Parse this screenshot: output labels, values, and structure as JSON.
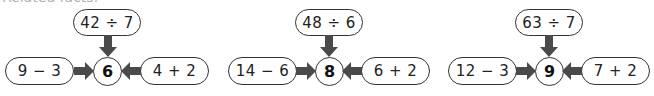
{
  "heading": "Related facts:",
  "arrow_color": "#4a4a4a",
  "border_color": "#333333",
  "groups": [
    {
      "result": "6",
      "top_expression": "42 ÷ 7",
      "left_expression": "9 − 3",
      "right_expression": "4 + 2"
    },
    {
      "result": "8",
      "top_expression": "48 ÷ 6",
      "left_expression": "14 − 6",
      "right_expression": "6 + 2"
    },
    {
      "result": "9",
      "top_expression": "63 ÷ 7",
      "left_expression": "12 − 3",
      "right_expression": "7 + 2"
    }
  ]
}
